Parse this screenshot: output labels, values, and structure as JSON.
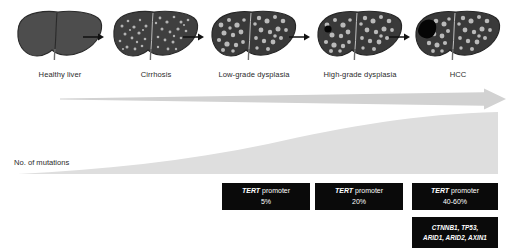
{
  "figure": {
    "type": "diagram",
    "background_color": "#ffffff"
  },
  "stages": [
    {
      "id": "healthy-liver",
      "label": "Healthy liver",
      "liver_style": "smooth",
      "center_x": 60,
      "nodules": 0,
      "tumor": "none"
    },
    {
      "id": "cirrhosis",
      "label": "Cirrhosis",
      "liver_style": "fine-nodular",
      "center_x": 156,
      "nodules": 70,
      "tumor": "none"
    },
    {
      "id": "low-grade-dysplasia",
      "label": "Low-grade dysplasia",
      "liver_style": "coarse-nodular",
      "center_x": 254,
      "nodules": 55,
      "tumor": "none"
    },
    {
      "id": "high-grade-dysplasia",
      "label": "High-grade dysplasia",
      "liver_style": "coarse-nodular",
      "center_x": 360,
      "nodules": 55,
      "tumor": "small"
    },
    {
      "id": "hcc",
      "label": "HCC",
      "liver_style": "coarse-nodular",
      "center_x": 458,
      "nodules": 55,
      "tumor": "large"
    }
  ],
  "step_arrows": [
    {
      "id": "arrow-healthy-to-cirrhosis",
      "x": 82
    },
    {
      "id": "arrow-cirrhosis-to-lowgrade",
      "x": 182
    },
    {
      "id": "arrow-lowgrade-to-highgrade",
      "x": 288
    },
    {
      "id": "arrow-highgrade-to-hcc",
      "x": 388
    }
  ],
  "progression_arrow": {
    "name": "disease-progression-arrow",
    "color": "#d2d2d2",
    "direction": "left-to-right"
  },
  "mutation_burden": {
    "label": "No. of mutations",
    "shape": "exponential-wedge",
    "color": "#dedede",
    "direction": "increasing-left-to-right"
  },
  "mutation_boxes": [
    {
      "id": "tert-cirrhosis",
      "gene": "TERT",
      "suffix": " promoter",
      "frequency": "5%",
      "stage": "Cirrhosis"
    },
    {
      "id": "tert-lowgrade",
      "gene": "TERT",
      "suffix": " promoter",
      "frequency": "20%",
      "stage": "Low-grade dysplasia"
    },
    {
      "id": "tert-hcc",
      "gene": "TERT",
      "suffix": " promoter",
      "frequency": "40-60%",
      "stage": "HCC"
    }
  ],
  "gene_panel": {
    "id": "hcc-driver-genes",
    "line_1": "CTNNB1, TP53,",
    "line_2": "ARID1, ARID2, AXIN1",
    "stage": "HCC"
  }
}
